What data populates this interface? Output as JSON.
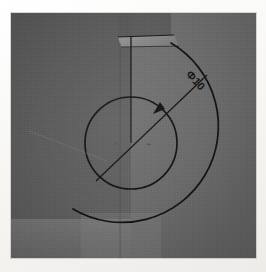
{
  "media": {
    "kind": "photograph-of-screen",
    "subject": "cad-part-circular-feature",
    "frame_color": "#fbfbfa",
    "photo_bounds": {
      "left": 11,
      "top": 13,
      "width": 245,
      "height": 245
    }
  },
  "scene": {
    "background_left_color": "#5e5e5e",
    "background_right_color": "#6e6e6e",
    "highlight_facet_color": "#8a8a8a",
    "lower_band_color": "#7c7c7c",
    "line_color": "#151515"
  },
  "geometry": {
    "inner_circle": {
      "cx": 120,
      "cy": 130,
      "r": 46,
      "label": "inner-circle"
    },
    "outer_arc": {
      "cx": 120,
      "cy": 130,
      "r": 95,
      "label": "outer-arc"
    },
    "center_point": {
      "x": 120,
      "y": 130
    },
    "vertical_edge": {
      "x": 120,
      "y_top": 24,
      "y_bottom": 130
    },
    "notch": {
      "x_left": 107,
      "x_right": 160,
      "y_top": 10,
      "y_bottom": 34
    }
  },
  "annotations": {
    "diameter_dimension": {
      "text": "Φ10",
      "symbol": "diameter-symbol",
      "value": "10",
      "rotation_deg": 48,
      "text_x": 182,
      "text_y": 70,
      "leader_start": {
        "x": 85,
        "y": 168
      },
      "leader_end": {
        "x": 196,
        "y": 62
      },
      "arrow_at": {
        "x": 153,
        "y": 97
      }
    },
    "center_marks": [
      {
        "glyph": "▫",
        "x": 104,
        "y": 131,
        "name": "center-mark-left"
      },
      {
        "glyph": "⌁",
        "x": 137,
        "y": 131,
        "name": "center-mark-right"
      }
    ]
  }
}
